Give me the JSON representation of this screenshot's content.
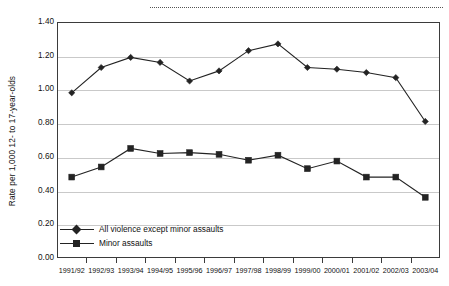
{
  "chart_data": {
    "type": "line",
    "title": "",
    "xlabel": "",
    "ylabel": "Rate per 1,000 12- to 17-year-olds",
    "ylim": [
      0.0,
      1.4
    ],
    "yticks": [
      "0.00",
      "0.20",
      "0.40",
      "0.60",
      "0.80",
      "1.00",
      "1.20",
      "1.40"
    ],
    "ytick_values": [
      0.0,
      0.2,
      0.4,
      0.6,
      0.8,
      1.0,
      1.2,
      1.4
    ],
    "grid": true,
    "legend_position": "inside lower-left",
    "categories": [
      "1991/92",
      "1992/93",
      "1993/94",
      "1994/95",
      "1995/96",
      "1996/97",
      "1997/98",
      "1998/99",
      "1999/00",
      "2000/01",
      "2001/02",
      "2002/03",
      "2003/04"
    ],
    "series": [
      {
        "name": "All violence except minor assaults",
        "marker": "diamond",
        "color": "#232323",
        "values": [
          0.98,
          1.13,
          1.19,
          1.16,
          1.05,
          1.11,
          1.23,
          1.27,
          1.13,
          1.12,
          1.1,
          1.07,
          0.81
        ]
      },
      {
        "name": "Minor assaults",
        "marker": "square",
        "color": "#232323",
        "values": [
          0.48,
          0.54,
          0.65,
          0.62,
          0.625,
          0.615,
          0.58,
          0.61,
          0.53,
          0.575,
          0.48,
          0.48,
          0.36
        ]
      }
    ],
    "annotations": [
      {
        "name": "top-dotted-rule",
        "text": ""
      }
    ]
  },
  "legend": {
    "items": [
      {
        "label": "All violence except minor assaults",
        "marker": "diamond"
      },
      {
        "label": "Minor assaults",
        "marker": "square"
      }
    ]
  }
}
